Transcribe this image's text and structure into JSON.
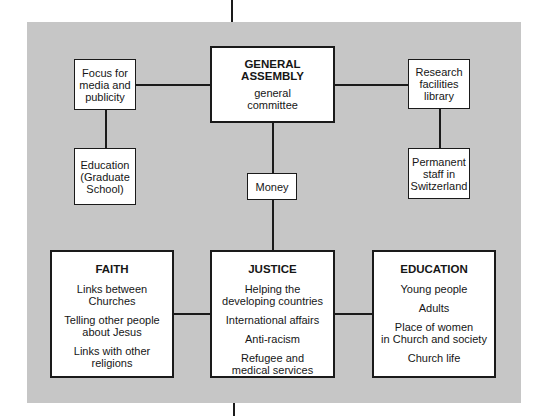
{
  "diagram": {
    "top": {
      "title": "GENERAL\nASSEMBLY",
      "subtitle": "general\ncommittee"
    },
    "left_nodes": [
      {
        "label": "Focus for\nmedia and\npublicity"
      },
      {
        "label": "Education\n(Graduate\nSchool)"
      }
    ],
    "right_nodes": [
      {
        "label": "Research\nfacilities\nlibrary"
      },
      {
        "label": "Permanent\nstaff in\nSwitzerland"
      }
    ],
    "money": {
      "label": "Money"
    },
    "pillars": [
      {
        "title": "FAITH",
        "items": [
          "Links between\nChurches",
          "Telling other people\nabout Jesus",
          "Links with other\nreligions"
        ]
      },
      {
        "title": "JUSTICE",
        "items": [
          "Helping the\ndeveloping countries",
          "International affairs",
          "Anti-racism",
          "Refugee and\nmedical services"
        ]
      },
      {
        "title": "EDUCATION",
        "items": [
          "Young people",
          "Adults",
          "Place of women\nin Church and society",
          "Church life"
        ]
      }
    ],
    "colors": {
      "panel": "#c6c6c6",
      "box": "#ffffff",
      "line": "#1a1a1a"
    }
  }
}
